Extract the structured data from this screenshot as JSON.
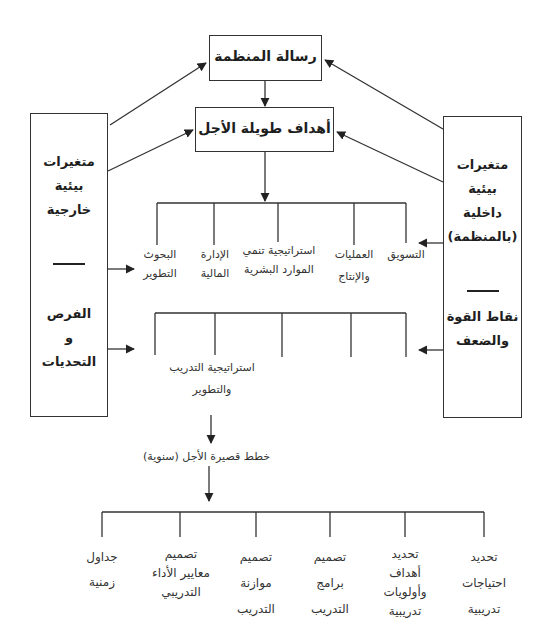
{
  "diagram": {
    "mission_box": {
      "label": "رسالة المنظمة"
    },
    "long_term_box": {
      "label": "أهداف طويلة الأجل"
    },
    "external_box": {
      "lines_top": [
        "متغيرات",
        "بيئية",
        "خارجية"
      ],
      "lines_bottom": [
        "الفرص",
        "و",
        "التحديات"
      ]
    },
    "internal_box": {
      "lines_top": [
        "متغيرات",
        "بيئية",
        "داخلية",
        "(بالمنظمة)"
      ],
      "lines_bottom": [
        "نقاط القوة",
        "والضعف"
      ]
    },
    "functional_strategies": [
      {
        "lines": [
          "التسويق"
        ]
      },
      {
        "lines": [
          "العمليات",
          "والإنتاج"
        ]
      },
      {
        "lines": [
          "استراتيجية تنمي",
          "الموارد البشرية"
        ]
      },
      {
        "lines": [
          "الإدارة",
          "المالية"
        ]
      },
      {
        "lines": [
          "البحوث",
          "التطوير"
        ]
      }
    ],
    "training_strategy": {
      "lines": [
        "استراتيجية التدريب",
        "والتطوير"
      ]
    },
    "short_term_plans": {
      "label": "خطط قصيرة الأجل (سنوية)"
    },
    "training_steps": [
      {
        "lines": [
          "تحديد",
          "احتياجات",
          "تدريبية"
        ]
      },
      {
        "lines": [
          "تحديد",
          "أهداف",
          "وأولويات",
          "تدريبية"
        ]
      },
      {
        "lines": [
          "تصميم",
          "برامج",
          "التدريب"
        ]
      },
      {
        "lines": [
          "تصميم",
          "موازنة",
          "التدريب"
        ]
      },
      {
        "lines": [
          "تصميم",
          "معايير الأداء",
          "التدريبي"
        ]
      },
      {
        "lines": [
          "جداول",
          "زمنية"
        ]
      }
    ]
  },
  "colors": {
    "line": "#333333",
    "text": "#1e1e1e"
  }
}
